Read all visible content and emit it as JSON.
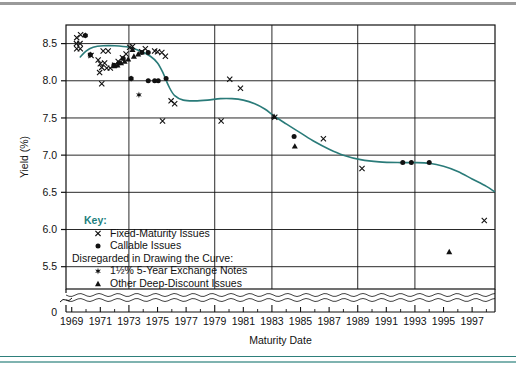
{
  "chart_data": {
    "type": "scatter",
    "title": "",
    "xlabel": "Maturity Date",
    "ylabel": "Yield (%)",
    "xlim": [
      1968.6,
      1998.6
    ],
    "ylim": [
      5.2,
      8.75
    ],
    "y_axis_break": true,
    "y_break_label": "0",
    "grid": true,
    "grid_x": [
      1973,
      1979,
      1983,
      1989,
      1993
    ],
    "grid_y": [
      5.5,
      6.0,
      6.5,
      7.0,
      7.5,
      8.0,
      8.5
    ],
    "xticks": [
      1969,
      1971,
      1973,
      1975,
      1977,
      1979,
      1981,
      1983,
      1985,
      1987,
      1989,
      1991,
      1993,
      1995,
      1997
    ],
    "xtick_labels": [
      "1969",
      "1971",
      "1973",
      "1975",
      "1977",
      "1979",
      "1981",
      "1983",
      "1985",
      "1987",
      "1989",
      "1991",
      "1993",
      "1995",
      "1997"
    ],
    "xtick_minor": [
      1970,
      1972,
      1974,
      1976,
      1978,
      1980,
      1982,
      1984,
      1986,
      1988,
      1990,
      1992,
      1994,
      1996,
      1998
    ],
    "yticks": [
      5.5,
      6.0,
      6.5,
      7.0,
      7.5,
      8.0,
      8.5
    ],
    "ytick_labels": [
      "5.5",
      "6.0",
      "6.5",
      "7.0",
      "7.5",
      "8.0",
      "8.5"
    ],
    "legend_position": "inside-lower-left",
    "curve_color": "#2a7b79",
    "marker_color": "#111111",
    "series": [
      {
        "name": "Fixed-Maturity Issues",
        "marker": "x",
        "points": [
          [
            1969.35,
            8.58
          ],
          [
            1969.62,
            8.62
          ],
          [
            1969.33,
            8.5
          ],
          [
            1969.58,
            8.5
          ],
          [
            1969.35,
            8.43
          ],
          [
            1969.6,
            8.43
          ],
          [
            1970.35,
            8.34
          ],
          [
            1970.85,
            8.28
          ],
          [
            1971.2,
            8.4
          ],
          [
            1971.55,
            8.4
          ],
          [
            1971.0,
            8.23
          ],
          [
            1971.3,
            8.24
          ],
          [
            1971.1,
            8.18
          ],
          [
            1971.45,
            8.17
          ],
          [
            1970.95,
            8.11
          ],
          [
            1971.7,
            8.17
          ],
          [
            1972.0,
            8.21
          ],
          [
            1972.25,
            8.26
          ],
          [
            1972.55,
            8.31
          ],
          [
            1972.8,
            8.36
          ],
          [
            1973.05,
            8.45
          ],
          [
            1973.25,
            8.46
          ],
          [
            1974.15,
            8.43
          ],
          [
            1974.8,
            8.4
          ],
          [
            1975.0,
            8.39
          ],
          [
            1975.3,
            8.38
          ],
          [
            1975.55,
            8.33
          ],
          [
            1973.9,
            8.39
          ],
          [
            1971.1,
            7.96
          ],
          [
            1975.95,
            7.73
          ],
          [
            1976.2,
            7.69
          ],
          [
            1975.35,
            7.46
          ],
          [
            1980.05,
            8.02
          ],
          [
            1980.8,
            7.9
          ],
          [
            1979.45,
            7.46
          ],
          [
            1983.2,
            7.51
          ],
          [
            1986.6,
            7.22
          ],
          [
            1989.3,
            6.82
          ],
          [
            1997.85,
            6.12
          ]
        ]
      },
      {
        "name": "Callable Issues",
        "marker": "dot",
        "points": [
          [
            1969.95,
            8.61
          ],
          [
            1970.3,
            8.35
          ],
          [
            1971.95,
            8.21
          ],
          [
            1972.3,
            8.24
          ],
          [
            1972.6,
            8.3
          ],
          [
            1973.9,
            8.38
          ],
          [
            1974.35,
            8.38
          ],
          [
            1973.15,
            8.03
          ],
          [
            1974.35,
            8.0
          ],
          [
            1974.8,
            8.0
          ],
          [
            1975.05,
            8.0
          ],
          [
            1975.6,
            8.03
          ],
          [
            1984.55,
            7.25
          ],
          [
            1992.15,
            6.9
          ],
          [
            1992.75,
            6.9
          ],
          [
            1994.0,
            6.9
          ]
        ]
      },
      {
        "name": "1½% 5-Year Exchange Notes",
        "marker": "star",
        "points": [
          [
            1969.95,
            8.61
          ],
          [
            1970.3,
            8.35
          ],
          [
            1973.15,
            8.03
          ],
          [
            1973.7,
            7.81
          ]
        ]
      },
      {
        "name": "Other Deep-Discount Issues",
        "marker": "triangle",
        "points": [
          [
            1973.25,
            8.42
          ],
          [
            1973.65,
            8.36
          ],
          [
            1973.35,
            8.33
          ],
          [
            1972.95,
            8.29
          ],
          [
            1972.7,
            8.26
          ],
          [
            1972.45,
            8.24
          ],
          [
            1972.2,
            8.21
          ],
          [
            1971.95,
            8.2
          ],
          [
            1983.15,
            7.52
          ],
          [
            1984.6,
            7.12
          ],
          [
            1995.4,
            5.7
          ]
        ]
      }
    ],
    "curve": {
      "name": "Fitted yield curve",
      "points": [
        [
          1969.6,
          8.32
        ],
        [
          1970.0,
          8.4
        ],
        [
          1970.5,
          8.45
        ],
        [
          1971.2,
          8.47
        ],
        [
          1972.0,
          8.47
        ],
        [
          1973.0,
          8.45
        ],
        [
          1973.8,
          8.4
        ],
        [
          1974.5,
          8.33
        ],
        [
          1975.0,
          8.24
        ],
        [
          1975.4,
          8.1
        ],
        [
          1975.8,
          7.92
        ],
        [
          1976.2,
          7.8
        ],
        [
          1976.8,
          7.74
        ],
        [
          1977.6,
          7.73
        ],
        [
          1978.5,
          7.74
        ],
        [
          1979.4,
          7.76
        ],
        [
          1980.2,
          7.76
        ],
        [
          1981.0,
          7.74
        ],
        [
          1981.8,
          7.69
        ],
        [
          1982.5,
          7.62
        ],
        [
          1983.2,
          7.52
        ],
        [
          1984.0,
          7.42
        ],
        [
          1985.0,
          7.3
        ],
        [
          1986.0,
          7.18
        ],
        [
          1987.0,
          7.08
        ],
        [
          1988.0,
          7.0
        ],
        [
          1989.2,
          6.94
        ],
        [
          1990.5,
          6.91
        ],
        [
          1992.0,
          6.9
        ],
        [
          1993.0,
          6.9
        ],
        [
          1994.0,
          6.89
        ],
        [
          1995.0,
          6.85
        ],
        [
          1996.0,
          6.78
        ],
        [
          1997.0,
          6.68
        ],
        [
          1998.0,
          6.58
        ],
        [
          1998.55,
          6.51
        ]
      ]
    },
    "key": {
      "title": "Key:",
      "entries": [
        {
          "marker": "x",
          "label": "Fixed-Maturity Issues"
        },
        {
          "marker": "dot",
          "label": "Callable Issues"
        }
      ],
      "subheading": "Disregarded in Drawing the Curve:",
      "sub_entries": [
        {
          "marker": "star",
          "label": "1½% 5-Year Exchange Notes"
        },
        {
          "marker": "triangle",
          "label": "Other Deep-Discount Issues"
        }
      ]
    }
  },
  "colors": {
    "accent_teal": "#2a7b79",
    "rule_gray": "#9a9a9a",
    "axis_black": "#111111"
  }
}
